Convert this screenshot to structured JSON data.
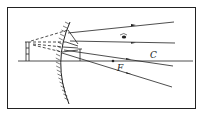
{
  "diagram": {
    "type": "optics-ray-diagram",
    "labels": {
      "center_of_curvature": "C",
      "focal_point": "F"
    },
    "elements": [
      "frame",
      "principal-axis",
      "convex-mirror",
      "object",
      "virtual-image",
      "incident-rays",
      "reflected-rays",
      "virtual-extensions",
      "eye"
    ],
    "colors": {
      "line": "#222222",
      "background": "#ffffff"
    }
  }
}
